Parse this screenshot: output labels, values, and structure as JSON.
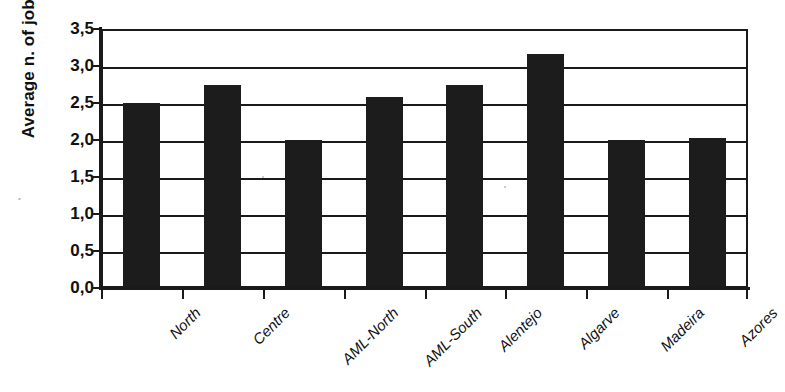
{
  "chart_data": {
    "type": "bar",
    "title": "",
    "xlabel": "",
    "ylabel": "Average n. of jobs",
    "ylim": [
      0,
      3.5
    ],
    "ytick_step": 0.5,
    "decimal_separator": ",",
    "grid": true,
    "legend": "none",
    "bar_color": "#1c1c1c",
    "axis_color": "#1a1a1a",
    "background_color": "#ffffff",
    "categories": [
      "North",
      "Centre",
      "AML-North",
      "AML-South",
      "Alentejo",
      "Algarve",
      "Madeira",
      "Azores"
    ],
    "values": [
      2.5,
      2.75,
      2.0,
      2.58,
      2.75,
      3.16,
      2.0,
      2.03
    ],
    "ytick_labels": [
      "3,5",
      "3,0",
      "2,5",
      "2,0",
      "1,5",
      "1,0",
      "0,5",
      "0,0"
    ],
    "ytick_values": [
      3.5,
      3.0,
      2.5,
      2.0,
      1.5,
      1.0,
      0.5,
      0.0
    ]
  }
}
